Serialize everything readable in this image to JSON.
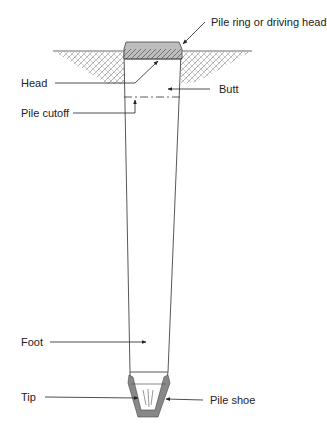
{
  "diagram": {
    "type": "pile-anatomy",
    "labels": {
      "pile_ring": "Pile ring or driving head",
      "head": "Head",
      "butt": "Butt",
      "pile_cutoff": "Pile cutoff",
      "foot": "Foot",
      "tip": "Tip",
      "pile_shoe": "Pile shoe"
    },
    "colors": {
      "line": "#333333",
      "hatch": "#666666",
      "cap_fill": "#b8b8b8",
      "shoe_fill": "#888888",
      "background": "#ffffff"
    }
  }
}
